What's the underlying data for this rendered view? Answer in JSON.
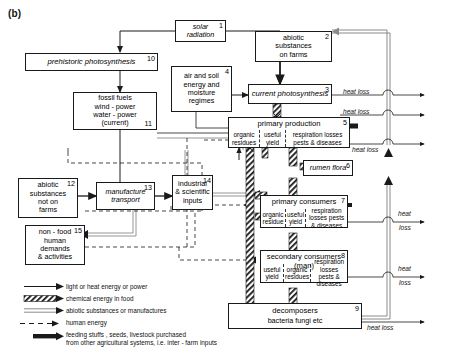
{
  "figure": {
    "panel_label": "(b)",
    "type": "energy-flow-diagram"
  },
  "nodes": [
    {
      "id": 1,
      "number": "1",
      "label": "solar radiation",
      "lines": [
        "solar",
        "radiation"
      ],
      "style": "italic"
    },
    {
      "id": 2,
      "number": "2",
      "label": "abiotic substances on farms",
      "lines": [
        "abiotic",
        "substances",
        "on farms"
      ],
      "style": "plain"
    },
    {
      "id": 3,
      "number": "3",
      "label": "current photosynthesis",
      "lines": [
        "current photosynthesis"
      ],
      "style": "italic"
    },
    {
      "id": 4,
      "number": "4",
      "label": "air and soil energy and moisture regimes",
      "lines": [
        "air and soil",
        "energy and",
        "moisture",
        "regimes"
      ],
      "style": "plain"
    },
    {
      "id": 5,
      "number": "5",
      "label": "primary production",
      "lines": [
        "primary production"
      ],
      "style": "plain",
      "compartments": [
        "organic residues",
        "useful yield",
        "respiration losses pests & diseases"
      ]
    },
    {
      "id": 6,
      "number": "6",
      "label": "rumen flora",
      "lines": [
        "rumen flora"
      ],
      "style": "italic"
    },
    {
      "id": 7,
      "number": "7",
      "label": "primary consumers",
      "lines": [
        "primary consumers"
      ],
      "style": "plain",
      "compartments": [
        "organic residue",
        "useful yield",
        "respiration losses pests & diseases"
      ]
    },
    {
      "id": 8,
      "number": "8",
      "label": "secondary consumers (man)",
      "lines": [
        "secondary consumers (man)"
      ],
      "style": "plain",
      "compartments": [
        "useful yield",
        "organic residues",
        "respiration losses pests & diseases"
      ]
    },
    {
      "id": 9,
      "number": "9",
      "label": "decomposers bacteria fungi etc",
      "lines": [
        "decomposers",
        "bacteria fungi etc"
      ],
      "style": "plain"
    },
    {
      "id": 10,
      "number": "10",
      "label": "prehistoric photosynthesis",
      "lines": [
        "prehistoric photosynthesis"
      ],
      "style": "italic"
    },
    {
      "id": 11,
      "number": "11",
      "label": "fossil fuels wind-power water-power (current)",
      "lines": [
        "fossil fuels",
        "wind - power",
        "water - power",
        "(current)"
      ],
      "style": "plain"
    },
    {
      "id": 12,
      "number": "12",
      "label": "abiotic substances not on farms",
      "lines": [
        "abiotic",
        "substances",
        "not on",
        "farms"
      ],
      "style": "plain"
    },
    {
      "id": 13,
      "number": "13",
      "label": "manufacture transport",
      "lines": [
        "manufacture",
        "transport"
      ],
      "style": "italic"
    },
    {
      "id": 14,
      "number": "14",
      "label": "industrial & scientific inputs",
      "lines": [
        "industrial",
        "& scientific",
        "inputs"
      ],
      "style": "plain"
    },
    {
      "id": 15,
      "number": "15",
      "label": "non-food human demands & activities",
      "lines": [
        "non - food",
        "human",
        "demands",
        "& activities"
      ],
      "style": "plain"
    }
  ],
  "heat_loss_labels": [
    {
      "id": "hl1",
      "text": "heat loss"
    },
    {
      "id": "hl2",
      "text": "heat loss"
    },
    {
      "id": "hl3",
      "text": "heat loss"
    },
    {
      "id": "hl4a",
      "text": "heat"
    },
    {
      "id": "hl4b",
      "text": "loss"
    },
    {
      "id": "hl5a",
      "text": "heat"
    },
    {
      "id": "hl5b",
      "text": "loss"
    },
    {
      "id": "hl6",
      "text": "heat loss"
    }
  ],
  "compartment_text": {
    "organic_residues": "organic residues",
    "organic_residue": "organic residue",
    "useful_yield": "useful yield",
    "respiration": "respiration losses pests & diseases"
  },
  "legend": {
    "items": [
      {
        "key": "solid-arrow-icon",
        "text": "light or heat energy or power"
      },
      {
        "key": "hatched-arrow-icon",
        "text": "chemical energy in food"
      },
      {
        "key": "double-line-arrow-icon",
        "text": "abiotic substances or manufactures"
      },
      {
        "key": "dashed-arrow-icon",
        "text": "human energy"
      },
      {
        "key": "thick-black-arrow-icon",
        "text": "feeding stuffs , seeds, livestock purchased\nfrom other agricultural systems, i.e. inter - farm inputs"
      }
    ],
    "lines": {
      "item5_line1": "feeding stuffs , seeds, livestock purchased",
      "item5_line2": "from other agricultural systems, i.e. inter - farm inputs"
    }
  },
  "colors": {
    "stroke": "#1a1a1a",
    "background": "#ffffff",
    "grey_line": "#8a8a8a",
    "hatch": "#1a1a1a"
  }
}
